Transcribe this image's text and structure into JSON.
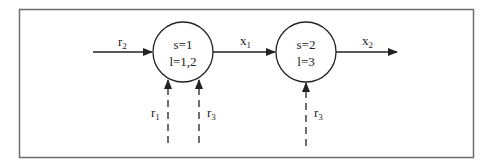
{
  "diagram": {
    "nodes": [
      {
        "id": "node-1",
        "line1": "s=1",
        "line2": "l=1,2"
      },
      {
        "id": "node-2",
        "line1": "s=2",
        "line2": "l=3"
      }
    ],
    "edges": {
      "r2_in": {
        "label": "r",
        "sub": "2",
        "style": "solid"
      },
      "x1": {
        "label": "x",
        "sub": "1",
        "style": "solid"
      },
      "x2_out": {
        "label": "x",
        "sub": "2",
        "style": "solid"
      },
      "r1_node1": {
        "label": "r",
        "sub": "1",
        "style": "dashed"
      },
      "r3_node1": {
        "label": "r",
        "sub": "3",
        "style": "dashed"
      },
      "r3_node2": {
        "label": "r",
        "sub": "3",
        "style": "dashed"
      }
    },
    "colors": {
      "line": "#222222",
      "border": "#6e6e6e"
    }
  }
}
